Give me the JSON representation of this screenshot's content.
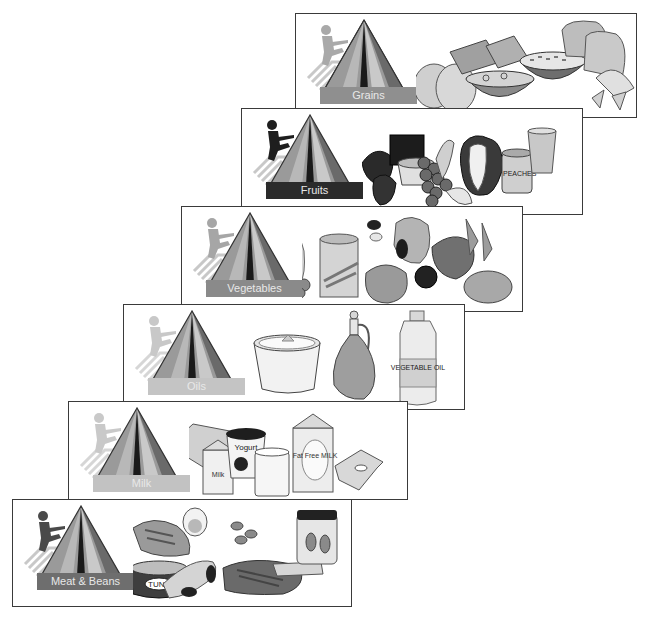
{
  "diagram": {
    "type": "food-groups-staircase",
    "panels": [
      {
        "id": "grains",
        "label": "Grains",
        "label_bar_color": "#8f8f8f",
        "figure_color": "#a9a9a9",
        "foods": [
          "bread-rolls",
          "crackers",
          "cereal-bowl",
          "soup-bowl-pasta",
          "bread-slices",
          "bow-tie-pasta"
        ]
      },
      {
        "id": "fruits",
        "label": "Fruits",
        "label_bar_color": "#2b2b2b",
        "figure_color": "#1e1e1e",
        "foods": [
          "strawberries",
          "juice-box",
          "fruit-cup",
          "grapes",
          "banana",
          "apple",
          "peaches-can",
          "juice-glass"
        ],
        "can_label": "PEACHES"
      },
      {
        "id": "vegetables",
        "label": "Vegetables",
        "label_bar_color": "#8a8a8a",
        "figure_color": "#a6a6a6",
        "foods": [
          "corn",
          "broccoli",
          "canned-green-beans",
          "kidney-beans",
          "lettuce",
          "sweet-potato",
          "tomato",
          "spinach",
          "carrots",
          "potato"
        ]
      },
      {
        "id": "oils",
        "label": "Oils",
        "label_bar_color": "#c4c4c4",
        "figure_color": "#c8c8c8",
        "foods": [
          "margarine-tub",
          "oil-cruet",
          "vegetable-oil-bottle"
        ],
        "bottle_label": "VEGETABLE OIL"
      },
      {
        "id": "milk",
        "label": "Milk",
        "label_bar_color": "#c2c2c2",
        "figure_color": "#c9c9c9",
        "foods": [
          "cheese-wedge",
          "milk-carton-small",
          "yogurt-cup",
          "milk-glass",
          "fat-free-milk-carton",
          "cheese-slices"
        ],
        "yogurt_label": "Yogurt",
        "small_carton_label": "Milk",
        "large_carton_label": "Fat Free MILK"
      },
      {
        "id": "meat-beans",
        "label": "Meat & Beans",
        "label_bar_color": "#6e6e6e",
        "figure_color": "#4a4a4a",
        "foods": [
          "fish-steak",
          "egg",
          "tuna-can",
          "chicken-drumstick",
          "kidney-beans",
          "nuts",
          "steak",
          "peanut-butter-jar",
          "fish-sticks"
        ],
        "can_label": "TUNA"
      }
    ]
  }
}
